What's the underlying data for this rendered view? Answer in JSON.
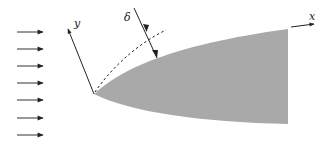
{
  "diagram": {
    "type": "boundary-layer-over-body",
    "labels": {
      "x_axis": "x",
      "y_axis": "y",
      "thickness": "δ"
    },
    "colors": {
      "body_fill": "#a9a9a9",
      "line": "#222222",
      "background": "#ffffff"
    },
    "flow_arrows": {
      "count": 7,
      "direction": "right",
      "y_positions": [
        32,
        49,
        66,
        83,
        100,
        118,
        135
      ]
    },
    "elements": [
      "uniform incoming flow arrows",
      "shaded body with rounded leading edge",
      "body-fitted x axis along surface",
      "y axis normal to surface at leading edge",
      "dashed boundary-layer edge curve",
      "double-headed arrow indicating boundary-layer thickness δ"
    ]
  }
}
